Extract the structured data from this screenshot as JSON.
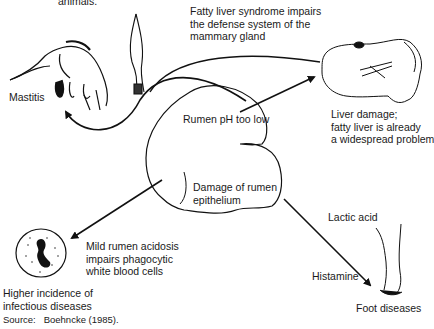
{
  "figure": {
    "top_cut_text": "animals.",
    "source_label": "Source:",
    "source_value": "Boehncke (1985).",
    "center": {
      "top_text": "Rumen pH too low",
      "bottom_text_line1": "Damage of rumen",
      "bottom_text_line2": "epithelium"
    },
    "mastitis": {
      "label": "Mastitis",
      "note_line1": "Fatty liver syndrome impairs",
      "note_line2": "the defense system of the",
      "note_line3": "mammary gland"
    },
    "liver": {
      "line1": "Liver damage;",
      "line2": "fatty liver is already",
      "line3": "a widespread problem"
    },
    "infection": {
      "note_line1": "Mild rumen acidosis",
      "note_line2": "impairs phagocytic",
      "note_line3": "white blood cells",
      "label_line1": "Higher incidence of",
      "label_line2": "infectious diseases"
    },
    "foot": {
      "lactic": "Lactic acid",
      "histamine": "Histamine",
      "label": "Foot diseases"
    }
  }
}
